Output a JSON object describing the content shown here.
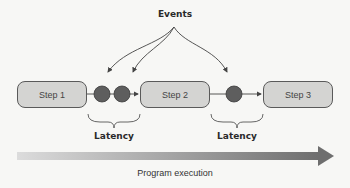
{
  "diagram": {
    "events_label": "Events",
    "steps": [
      {
        "label": "Step 1"
      },
      {
        "label": "Step 2"
      },
      {
        "label": "Step 3"
      }
    ],
    "latency_labels": [
      "Latency",
      "Latency"
    ],
    "timeline_label": "Program execution",
    "event_counts_between_steps": [
      2,
      1
    ],
    "colors": {
      "step_fill": "#d4d4d2",
      "step_border": "#5a5a5a",
      "event_fill": "#5e5e5e",
      "arrow_gradient_start": "#d8d8d8",
      "arrow_gradient_end": "#707070",
      "background": "#f7f7f5"
    }
  }
}
